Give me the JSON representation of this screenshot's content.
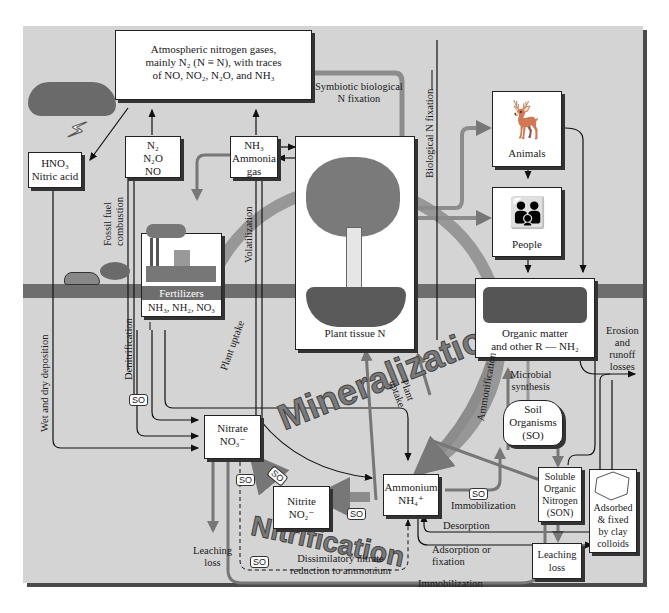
{
  "diagram": {
    "colors": {
      "panel": "#d4d4d4",
      "ground": "#6e6e6e",
      "box": "#ffffff",
      "big_arrow": "#8c8c8c",
      "line": "#1a1a1a"
    },
    "boxes": {
      "atmosphere": {
        "line1": "Atmospheric nitrogen gases,",
        "line2": "mainly N₂ (N ≡ N), with traces",
        "line3": "of NO, NO₂, N₂O, and NH₃"
      },
      "nitric_acid": {
        "line1": "HNO₃",
        "line2": "Nitric acid"
      },
      "n_gases": {
        "line1": "N₂",
        "line2": "N₂O",
        "line3": "NO"
      },
      "ammonia_gas": {
        "line1": "NH₃",
        "line2": "Ammonia",
        "line3": "gas"
      },
      "fertilizers": {
        "title": "Fertilizers",
        "formula": "NH₃, NH₂, NO₃"
      },
      "plant_tissue": {
        "label": "Plant tissue N"
      },
      "animals": {
        "label": "Animals"
      },
      "people": {
        "label": "People"
      },
      "organic_matter": {
        "line1": "Organic matter",
        "line2": "and other R — NH₂"
      },
      "soil_organisms": {
        "line1": "Soil",
        "line2": "Organisms",
        "line3": "(SO)"
      },
      "nitrate": {
        "line1": "Nitrate",
        "line2": "NO₃⁻"
      },
      "nitrite": {
        "line1": "Nitrite",
        "line2": "NO₂⁻"
      },
      "ammonium": {
        "line1": "Ammonium",
        "line2": "NH₄⁺"
      },
      "son": {
        "line1": "Soluble",
        "line2": "Organic",
        "line3": "Nitrogen",
        "line4": "(SON)"
      },
      "leaching_son": {
        "line1": "Leaching",
        "line2": "loss"
      },
      "clay": {
        "line1": "Adsorbed",
        "line2": "& fixed",
        "line3": "by clay",
        "line4": "colloids"
      }
    },
    "labels": {
      "symbiotic": {
        "line1": "Symbiotic biological",
        "line2": "N fixation"
      },
      "biological_fixation": "Biological N fixation",
      "fossil_fuel": {
        "line1": "Fossil fuel",
        "line2": "combustion"
      },
      "volatilization": "Volatilization",
      "wet_dry": "Wet and dry deposition",
      "denitrification": "Denitrification",
      "plant_uptake_left": "Plant uptake",
      "plant_uptake_right": {
        "line1": "Plant",
        "line2": "uptake"
      },
      "ammonification": "Ammonification",
      "microbial": {
        "line1": "Microbial",
        "line2": "synthesis"
      },
      "erosion": {
        "line1": "Erosion",
        "line2": "and",
        "line3": "runoff",
        "line4": "losses"
      },
      "leaching_loss": {
        "line1": "Leaching",
        "line2": "loss"
      },
      "immobilization_top": "Immobilization",
      "desorption": "Desorption",
      "adsorption": {
        "line1": "Adsorption or",
        "line2": "fixation"
      },
      "dissimilatory": {
        "line1": "Dissimilatory nitrate",
        "line2": "reduction to ammonium"
      },
      "immobilization_bottom": "Immobilization",
      "mineralization": "Mineralization",
      "nitrification": "Nitrification",
      "so_tag": "SO"
    }
  }
}
